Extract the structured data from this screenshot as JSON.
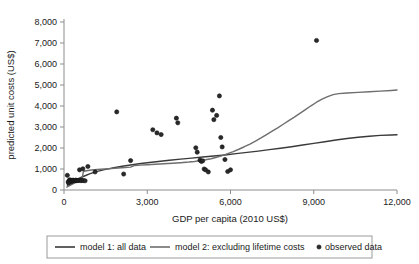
{
  "chart_data": {
    "type": "scatter",
    "title": "",
    "xlabel": "GDP per capita (2010 US$)",
    "ylabel": "predicted unit costs (US$)",
    "xlim": [
      0,
      12000
    ],
    "ylim": [
      0,
      8000
    ],
    "grid": false,
    "legend_position": "bottom",
    "xticks": [
      0,
      3000,
      6000,
      9000,
      12000
    ],
    "xticklabels": [
      "0",
      "3,000",
      "6,000",
      "9,000",
      "12,000"
    ],
    "yticks": [
      0,
      1000,
      2000,
      3000,
      4000,
      5000,
      6000,
      7000,
      8000
    ],
    "yticklabels": [
      "0",
      "1,000",
      "2,000",
      "3,000",
      "4,000",
      "5,000",
      "6,000",
      "7,000",
      "8,000"
    ],
    "series": [
      {
        "name": "model 1: all data",
        "type": "line",
        "color": "#3a3a3a",
        "points": [
          [
            120,
            230
          ],
          [
            200,
            300
          ],
          [
            300,
            380
          ],
          [
            420,
            470
          ],
          [
            520,
            540
          ],
          [
            650,
            620
          ],
          [
            780,
            690
          ],
          [
            900,
            760
          ],
          [
            1050,
            830
          ],
          [
            1200,
            890
          ],
          [
            1500,
            980
          ],
          [
            1800,
            1060
          ],
          [
            2100,
            1130
          ],
          [
            2400,
            1190
          ],
          [
            2700,
            1250
          ],
          [
            3000,
            1300
          ],
          [
            3400,
            1360
          ],
          [
            3800,
            1420
          ],
          [
            4200,
            1470
          ],
          [
            4600,
            1520
          ],
          [
            5000,
            1570
          ],
          [
            5400,
            1620
          ],
          [
            5800,
            1670
          ],
          [
            6200,
            1730
          ],
          [
            6600,
            1790
          ],
          [
            7000,
            1850
          ],
          [
            7400,
            1920
          ],
          [
            7800,
            1990
          ],
          [
            8200,
            2060
          ],
          [
            8600,
            2140
          ],
          [
            9000,
            2220
          ],
          [
            9400,
            2300
          ],
          [
            9800,
            2380
          ],
          [
            10200,
            2450
          ],
          [
            10600,
            2510
          ],
          [
            11000,
            2560
          ],
          [
            11400,
            2600
          ],
          [
            11800,
            2620
          ],
          [
            12000,
            2630
          ]
        ]
      },
      {
        "name": "model 2: excluding lifetime costs",
        "type": "line",
        "color": "#6e6e6e",
        "points": [
          [
            100,
            140
          ],
          [
            200,
            210
          ],
          [
            320,
            290
          ],
          [
            450,
            370
          ],
          [
            560,
            430
          ],
          [
            640,
            470
          ],
          [
            700,
            880
          ],
          [
            760,
            905
          ],
          [
            860,
            930
          ],
          [
            1000,
            950
          ],
          [
            1200,
            975
          ],
          [
            1450,
            1000
          ],
          [
            1700,
            1020
          ],
          [
            1950,
            1045
          ],
          [
            2200,
            1075
          ],
          [
            2400,
            1090
          ],
          [
            2550,
            1170
          ],
          [
            2750,
            1185
          ],
          [
            3000,
            1200
          ],
          [
            3300,
            1225
          ],
          [
            3600,
            1250
          ],
          [
            3900,
            1275
          ],
          [
            4200,
            1300
          ],
          [
            4500,
            1330
          ],
          [
            4700,
            1360
          ],
          [
            4900,
            1400
          ],
          [
            5100,
            1440
          ],
          [
            5300,
            1490
          ],
          [
            5500,
            1560
          ],
          [
            5700,
            1640
          ],
          [
            5900,
            1730
          ],
          [
            6100,
            1830
          ],
          [
            6300,
            1940
          ],
          [
            6500,
            2060
          ],
          [
            6700,
            2190
          ],
          [
            6900,
            2330
          ],
          [
            7100,
            2480
          ],
          [
            7300,
            2640
          ],
          [
            7500,
            2800
          ],
          [
            7700,
            2960
          ],
          [
            7900,
            3130
          ],
          [
            8100,
            3300
          ],
          [
            8300,
            3470
          ],
          [
            8500,
            3650
          ],
          [
            8700,
            3830
          ],
          [
            8900,
            4010
          ],
          [
            9100,
            4180
          ],
          [
            9300,
            4330
          ],
          [
            9500,
            4450
          ],
          [
            9700,
            4540
          ],
          [
            9900,
            4590
          ],
          [
            10200,
            4620
          ],
          [
            10600,
            4650
          ],
          [
            11000,
            4680
          ],
          [
            11400,
            4710
          ],
          [
            11800,
            4740
          ],
          [
            12000,
            4760
          ]
        ]
      }
    ],
    "scatter": {
      "name": "observed data",
      "color": "#2a2a2a",
      "marker": "circle",
      "points": [
        [
          120,
          700
        ],
        [
          150,
          380
        ],
        [
          170,
          330
        ],
        [
          180,
          430
        ],
        [
          200,
          480
        ],
        [
          220,
          470
        ],
        [
          240,
          420
        ],
        [
          260,
          390
        ],
        [
          280,
          460
        ],
        [
          300,
          430
        ],
        [
          330,
          470
        ],
        [
          360,
          440
        ],
        [
          400,
          455
        ],
        [
          430,
          470
        ],
        [
          460,
          445
        ],
        [
          500,
          450
        ],
        [
          540,
          460
        ],
        [
          560,
          960
        ],
        [
          600,
          450
        ],
        [
          640,
          455
        ],
        [
          680,
          1010
        ],
        [
          700,
          450
        ],
        [
          760,
          440
        ],
        [
          860,
          1120
        ],
        [
          1120,
          860
        ],
        [
          1900,
          3720
        ],
        [
          2150,
          760
        ],
        [
          2400,
          1400
        ],
        [
          3200,
          2870
        ],
        [
          3350,
          2720
        ],
        [
          3500,
          2640
        ],
        [
          4050,
          3420
        ],
        [
          4100,
          3200
        ],
        [
          4750,
          2010
        ],
        [
          4800,
          1800
        ],
        [
          4900,
          1420
        ],
        [
          4950,
          1360
        ],
        [
          5000,
          1390
        ],
        [
          5050,
          1000
        ],
        [
          5100,
          960
        ],
        [
          5200,
          860
        ],
        [
          5350,
          3800
        ],
        [
          5400,
          3350
        ],
        [
          5500,
          3550
        ],
        [
          5600,
          4480
        ],
        [
          5650,
          2500
        ],
        [
          5700,
          2050
        ],
        [
          5800,
          1450
        ],
        [
          5900,
          880
        ],
        [
          6000,
          960
        ],
        [
          9100,
          7120
        ]
      ]
    }
  },
  "legend": {
    "entries": [
      {
        "label": "model 1: all data",
        "kind": "line",
        "color": "#3a3a3a"
      },
      {
        "label": "model 2: excluding lifetime costs",
        "kind": "line",
        "color": "#6e6e6e"
      },
      {
        "label": "observed data",
        "kind": "marker",
        "color": "#2a2a2a"
      }
    ]
  }
}
